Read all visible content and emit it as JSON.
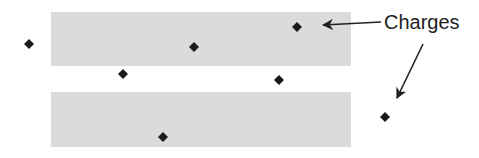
{
  "diagram": {
    "label": "Charges",
    "colors": {
      "slab_fill": "#d9d9d9",
      "charge": "#1a1a1a",
      "arrow": "#222222",
      "background": "#ffffff"
    },
    "slabs": [
      {
        "name": "top-slab",
        "x": 51,
        "y": 12,
        "width": 300,
        "height": 54
      },
      {
        "name": "bottom-slab",
        "x": 51,
        "y": 92,
        "width": 300,
        "height": 55
      }
    ],
    "charges": [
      {
        "x": 29,
        "y": 44
      },
      {
        "x": 123,
        "y": 74
      },
      {
        "x": 194,
        "y": 47
      },
      {
        "x": 297,
        "y": 27
      },
      {
        "x": 279,
        "y": 80
      },
      {
        "x": 163,
        "y": 137
      },
      {
        "x": 385,
        "y": 117
      }
    ],
    "arrows": [
      {
        "name": "arrow-to-slab-charge",
        "x1": 381,
        "y1": 22,
        "x2": 323,
        "y2": 25
      },
      {
        "name": "arrow-to-free-charge",
        "x1": 423,
        "y1": 44,
        "x2": 397,
        "y2": 98
      }
    ]
  }
}
